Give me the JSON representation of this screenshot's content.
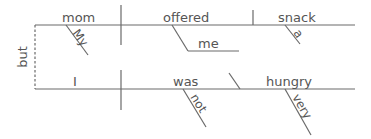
{
  "diagram": {
    "type": "reed-kellogg-sentence-diagram",
    "sentence": "My mom offered me a snack, but I was not very hungry.",
    "conjunction": "but",
    "clause1": {
      "subject": "mom",
      "subject_modifier": "My",
      "verb": "offered",
      "indirect_object": "me",
      "direct_object": "snack",
      "direct_object_modifier": "a"
    },
    "clause2": {
      "subject": "I",
      "verb": "was",
      "verb_modifier": "not",
      "predicate_adjective": "hungry",
      "predicate_adjective_modifier": "very"
    },
    "colors": {
      "line": "#6a6a6a",
      "text": "#555555",
      "background": "#ffffff"
    }
  }
}
